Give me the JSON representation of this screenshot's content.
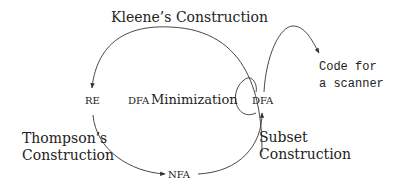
{
  "diagram": {
    "nodes": {
      "re": "RE",
      "nfa": "NFA",
      "dfa": "DFA"
    },
    "edges": {
      "kleene": "Kleene’s Construction",
      "thompson_line1": "Thompson’s",
      "thompson_line2": "Construction",
      "subset_line1": "Subset",
      "subset_line2": "Construction",
      "minimization_prefix": "DFA",
      "minimization_word": "Minimization"
    },
    "output": {
      "line1": "Code for",
      "line2": "a scanner"
    }
  }
}
